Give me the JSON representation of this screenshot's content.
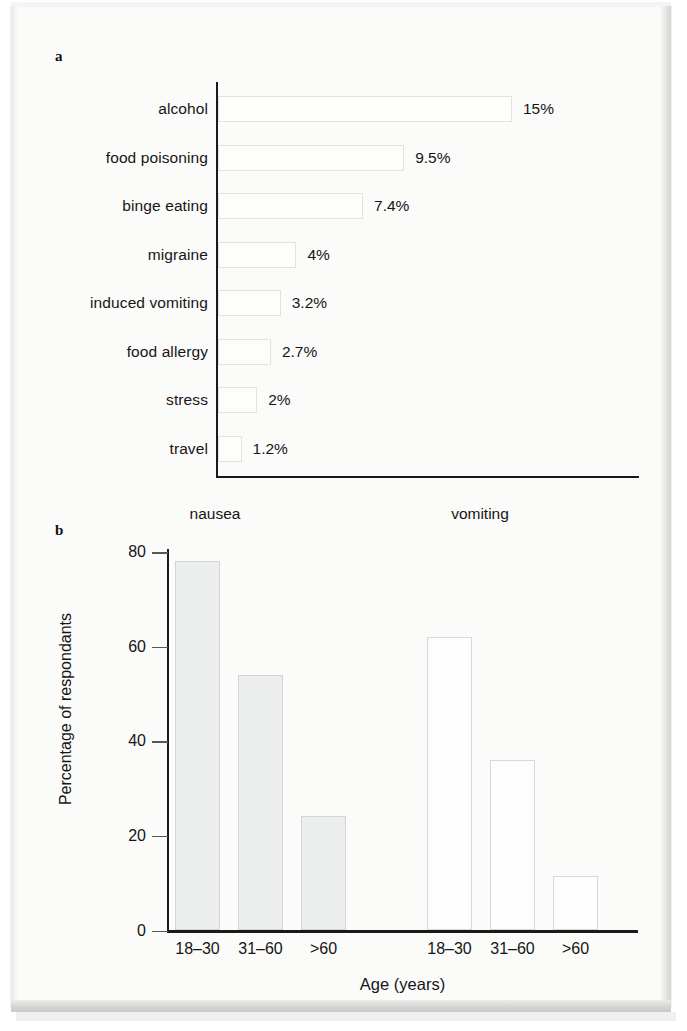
{
  "figure": {
    "panel_a_letter": "a",
    "panel_b_letter": "b"
  },
  "chart_data": [
    {
      "type": "bar",
      "orientation": "horizontal",
      "panel": "a",
      "title": "",
      "xlabel": "",
      "ylabel": "",
      "xlim": [
        0,
        16
      ],
      "grid": false,
      "legend": "none",
      "categories": [
        "alcohol",
        "food poisoning",
        "binge eating",
        "migraine",
        "induced vomiting",
        "food allergy",
        "stress",
        "travel"
      ],
      "values": [
        15,
        9.5,
        7.4,
        4,
        3.2,
        2.7,
        2,
        1.2
      ],
      "value_labels": [
        "15%",
        "9.5%",
        "7.4%",
        "4%",
        "3.2%",
        "2.7%",
        "2%",
        "1.2%"
      ]
    },
    {
      "type": "bar",
      "orientation": "vertical",
      "panel": "b",
      "title": "",
      "xlabel": "Age (years)",
      "ylabel": "Percentage of respondants",
      "ylim": [
        0,
        80
      ],
      "yticks": [
        0,
        20,
        40,
        60,
        80
      ],
      "ytick_labels": [
        "0",
        "20",
        "40",
        "60",
        "80"
      ],
      "grid": false,
      "legend": "none",
      "group_labels": [
        "nausea",
        "vomiting"
      ],
      "categories": [
        "18–30",
        "31–60",
        ">60",
        "18–30",
        "31–60",
        ">60"
      ],
      "series": [
        {
          "name": "nausea",
          "categories": [
            "18–30",
            "31–60",
            ">60"
          ],
          "values": [
            78,
            54,
            24
          ]
        },
        {
          "name": "vomiting",
          "categories": [
            "18–30",
            "31–60",
            ">60"
          ],
          "values": [
            62,
            36,
            11.5
          ]
        }
      ]
    }
  ],
  "colors": {
    "axis": "#1a1a1a",
    "bar_fill_nausea": "#eceeed",
    "bar_fill_vomiting": "#fdfdfd",
    "bar_border": "#d5d7d6",
    "text": "#151515",
    "paper": "#fbfbfa"
  }
}
